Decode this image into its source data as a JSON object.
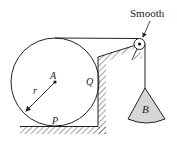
{
  "diagram": {
    "labels": {
      "smooth": "Smooth",
      "center": "A",
      "radius": "r",
      "wall_contact": "Q",
      "floor_contact": "P",
      "weight": "B"
    },
    "colors": {
      "stroke": "#222222",
      "weight_fill": "#d6d6d6",
      "background": "#ffffff"
    },
    "elements": [
      "cylinder with center A and radius r",
      "floor contact point P",
      "vertical wall contact point Q",
      "smooth pulley at top right",
      "rope from top of cylinder over pulley to hanging weight B"
    ]
  }
}
